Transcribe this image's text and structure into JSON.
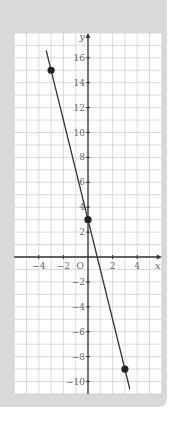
{
  "chart_data": {
    "type": "line",
    "title": "",
    "xlabel": "x",
    "ylabel": "y",
    "origin_label": "O",
    "xlim": [
      -6,
      6
    ],
    "ylim": [
      -11,
      18
    ],
    "grid": true,
    "x_ticks": [
      -4,
      -2,
      2,
      4
    ],
    "x_tick_labels": [
      "−4",
      "−2",
      "2",
      "4"
    ],
    "y_ticks": [
      16,
      14,
      12,
      10,
      8,
      6,
      4,
      2,
      -2,
      -4,
      -6,
      -8,
      -10
    ],
    "y_tick_labels": [
      "16",
      "14",
      "12",
      "10",
      "8",
      "6",
      "4",
      "2",
      "−2",
      "−4",
      "−6",
      "−8",
      "−10"
    ],
    "series": [
      {
        "name": "line",
        "equation": "y = -4x + 3",
        "line_from": [
          -3.4,
          16.6
        ],
        "line_to": [
          3.4,
          -10.6
        ],
        "points": [
          {
            "x": -3,
            "y": 15
          },
          {
            "x": 0,
            "y": 3
          },
          {
            "x": 3,
            "y": -9
          }
        ]
      }
    ],
    "colors": {
      "panel": "#d9d9d9",
      "plot_background": "#ffffff",
      "grid": "#d0d0d0",
      "axis": "#333333",
      "line": "#333333",
      "points": "#222222"
    }
  }
}
